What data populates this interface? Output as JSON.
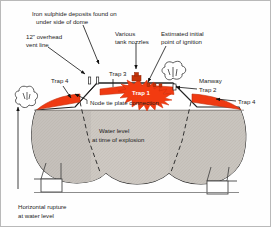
{
  "figure": {
    "type": "engineering-cross-section-diagram"
  },
  "colors": {
    "trap_red": "#ef3a12",
    "trap_red_dark": "#d02c08",
    "water_grey": "#cdc8c2",
    "vapor_white": "#ffffff",
    "outline": "#222222",
    "frame": "#b9b9b9",
    "label_text": "#1c1c1c",
    "starburst": "#f23b10"
  },
  "annotations": {
    "iron_sulphide": "Iron sulphide deposits found on\nunder side of dome",
    "iron_sulphide_line1": "Iron sulphide deposits found on",
    "iron_sulphide_line2": "under side of dome",
    "vent_line1": "12\" overhead",
    "vent_line2": "vent line",
    "nozzles_line1": "Various",
    "nozzles_line2": "tank nozzles",
    "ignition_line1": "Estimated initial",
    "ignition_line2": "point of ignition",
    "manway_line1": "Manway",
    "manway_line2": "Trap 2",
    "node_tie": "Node tie plate connection",
    "water_level_line1": "Water level",
    "water_level_line2": "at time of explosion",
    "rupture_line1": "Horizontal rupture",
    "rupture_line2": "at water level"
  },
  "traps": {
    "trap4_left": "Trap 4",
    "trap4_right": "Trap 4",
    "trap3": "Trap 3",
    "trap1": "Trap 1",
    "trap2": "Trap 2"
  },
  "icons": {
    "smoke_left": "smoke-plume-icon",
    "smoke_right": "smoke-plume-icon",
    "starburst": "explosion-starburst-icon",
    "nozzle": "tank-nozzle-icon",
    "arrow": "leader-arrow-icon"
  }
}
